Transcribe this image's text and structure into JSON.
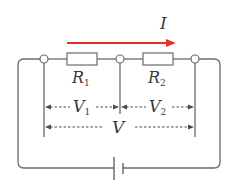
{
  "diagram": {
    "type": "series-circuit",
    "current": {
      "label": "I",
      "direction": "left-to-right",
      "color": "#e8302a"
    },
    "resistors": [
      {
        "label": "R",
        "subscript": "1"
      },
      {
        "label": "R",
        "subscript": "2"
      }
    ],
    "voltages": [
      {
        "label": "V",
        "subscript": "1",
        "spans": "R1"
      },
      {
        "label": "V",
        "subscript": "2",
        "spans": "R2"
      },
      {
        "label": "V",
        "subscript": "",
        "spans": "R1+R2"
      }
    ],
    "source": {
      "type": "battery"
    },
    "nodes": 3,
    "colors": {
      "wire": "#6b6b6b",
      "arrow": "#e8302a",
      "text": "#3a3a3a"
    }
  }
}
